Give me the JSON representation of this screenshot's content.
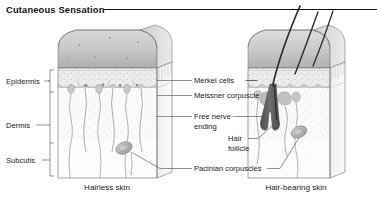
{
  "header": {
    "title": "Cutaneous Sensation",
    "rule_color": "#111111"
  },
  "layer_labels": [
    {
      "id": "epidermis",
      "text": "Epidermis"
    },
    {
      "id": "dermis",
      "text": "Dermis"
    },
    {
      "id": "subcutis",
      "text": "Subcutis"
    }
  ],
  "structure_labels": [
    {
      "id": "merkel-cells",
      "text": "Merkel cells"
    },
    {
      "id": "meissner-corpuscle",
      "text": "Meissner corpuscle"
    },
    {
      "id": "free-nerve-ending",
      "line1": "Free nerve",
      "line2": "ending"
    },
    {
      "id": "hair-follicle",
      "line1": "Hair",
      "line2": "follicle"
    },
    {
      "id": "pacinian-corpuscles",
      "text": "Pacinian corpuscles"
    }
  ],
  "captions": [
    {
      "id": "hairless-skin",
      "text": "Hairless skin"
    },
    {
      "id": "hair-bearing-skin",
      "text": "Hair-bearing skin"
    }
  ],
  "diagram": {
    "type": "anatomical-cross-section",
    "blocks": [
      {
        "id": "hairless-block",
        "caption": "Hairless skin",
        "hairs": 0,
        "features": [
          "merkel-cells",
          "meissner-corpuscle",
          "free-nerve-ending",
          "pacinian-corpuscle"
        ]
      },
      {
        "id": "hair-bearing-block",
        "caption": "Hair-bearing skin",
        "hairs": 3,
        "features": [
          "hair-follicle",
          "free-nerve-ending",
          "pacinian-corpuscle",
          "sebaceous-gland"
        ]
      }
    ],
    "layers": [
      "Epidermis",
      "Dermis",
      "Subcutis"
    ],
    "palette": {
      "surface_light": "#e6e6e6",
      "surface_dark": "#b4b4b4",
      "epidermis": "#ededed",
      "dermis": "#f6f6f6",
      "subcutis": "#fafafa",
      "hair": "#2b2b2b",
      "outline": "#6b6b6b",
      "text": "#1a1a1a"
    }
  }
}
